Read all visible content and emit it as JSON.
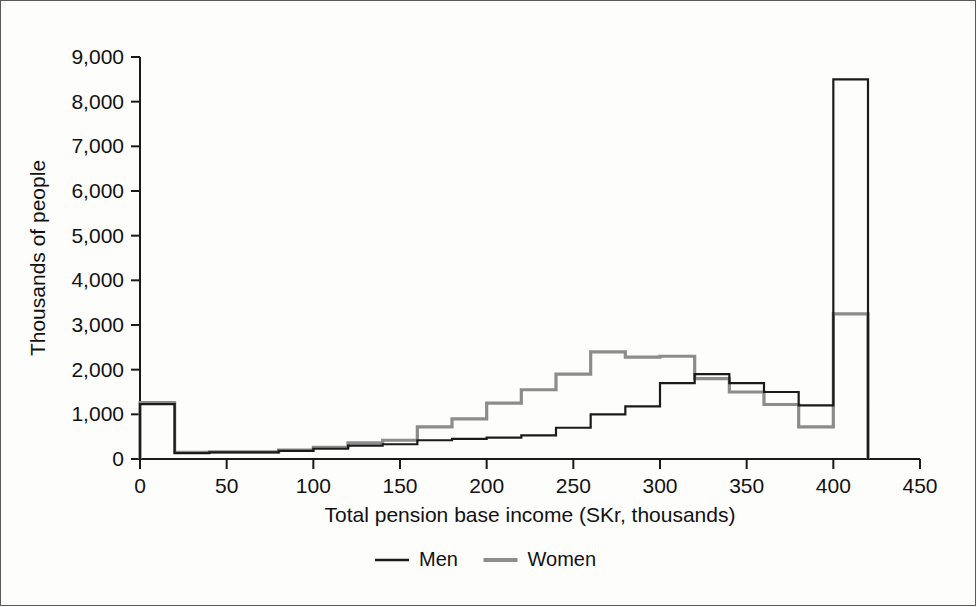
{
  "chart_data": {
    "type": "line",
    "subtype": "step-histogram",
    "title": "",
    "xlabel": "Total pension base income (SKr, thousands)",
    "ylabel": "Thousands of people",
    "xlim": [
      0,
      450
    ],
    "ylim": [
      0,
      9000
    ],
    "xticks": [
      0,
      50,
      100,
      150,
      200,
      250,
      300,
      350,
      400,
      450
    ],
    "xtick_labels": [
      "0",
      "50",
      "100",
      "150",
      "200",
      "250",
      "300",
      "350",
      "400",
      "450"
    ],
    "yticks": [
      0,
      1000,
      2000,
      3000,
      4000,
      5000,
      6000,
      7000,
      8000,
      9000
    ],
    "ytick_labels": [
      "0",
      "1,000",
      "2,000",
      "3,000",
      "4,000",
      "5,000",
      "6,000",
      "7,000",
      "8,000",
      "9,000"
    ],
    "grid": false,
    "legend_position": "bottom",
    "bin_width": 20,
    "bin_edges": [
      0,
      20,
      40,
      60,
      80,
      100,
      120,
      140,
      160,
      180,
      200,
      220,
      240,
      260,
      280,
      300,
      320,
      340,
      360,
      380,
      400,
      420
    ],
    "bin_centers": [
      10,
      30,
      50,
      70,
      90,
      110,
      130,
      150,
      170,
      190,
      210,
      230,
      250,
      270,
      290,
      310,
      330,
      350,
      370,
      390,
      410
    ],
    "series": [
      {
        "name": "Men",
        "color": "#1b1b1b",
        "values": [
          1230,
          130,
          150,
          150,
          180,
          230,
          300,
          330,
          420,
          450,
          480,
          530,
          700,
          1000,
          1180,
          1700,
          1900,
          1700,
          1500,
          1200,
          8500
        ]
      },
      {
        "name": "Women",
        "color": "#8c8c8c",
        "values": [
          1260,
          150,
          160,
          160,
          200,
          260,
          360,
          420,
          720,
          900,
          1250,
          1550,
          1900,
          2400,
          2280,
          2300,
          1800,
          1500,
          1220,
          720,
          3250
        ]
      }
    ],
    "legend": [
      {
        "label": "Men",
        "color": "#1b1b1b"
      },
      {
        "label": "Women",
        "color": "#8c8c8c"
      }
    ]
  }
}
